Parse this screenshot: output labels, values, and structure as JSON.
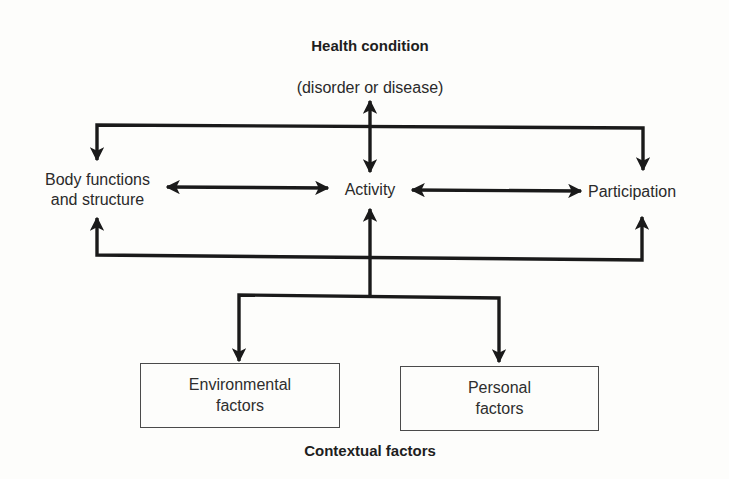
{
  "diagram": {
    "type": "flow",
    "nodes": {
      "health_condition": {
        "title": "Health condition",
        "subtitle": "(disorder or disease)"
      },
      "body_functions": {
        "line1": "Body functions",
        "line2": "and structure"
      },
      "activity": {
        "label": "Activity"
      },
      "participation": {
        "label": "Participation"
      },
      "environmental": {
        "line1": "Environmental",
        "line2": "factors"
      },
      "personal": {
        "line1": "Personal",
        "line2": "factors"
      },
      "contextual": {
        "title": "Contextual factors"
      }
    },
    "edges": [
      {
        "from": "health_condition",
        "to": "activity",
        "direction": "both"
      },
      {
        "from": "body_functions",
        "to": "activity",
        "direction": "both"
      },
      {
        "from": "activity",
        "to": "participation",
        "direction": "both"
      },
      {
        "from": "top_bus",
        "to": "body_functions",
        "direction": "to"
      },
      {
        "from": "top_bus",
        "to": "participation",
        "direction": "to"
      },
      {
        "from": "bottom_bus",
        "to": "body_functions",
        "direction": "to"
      },
      {
        "from": "bottom_bus",
        "to": "participation",
        "direction": "to"
      },
      {
        "from": "contextual_bus",
        "to": "activity",
        "direction": "to"
      },
      {
        "from": "contextual_bus",
        "to": "environmental",
        "direction": "to"
      },
      {
        "from": "contextual_bus",
        "to": "personal",
        "direction": "to"
      }
    ],
    "colors": {
      "line": "#1a1a1a",
      "text": "#2a2a2a",
      "box_border": "#4a4a4a",
      "background": "#fdfdfb"
    }
  }
}
